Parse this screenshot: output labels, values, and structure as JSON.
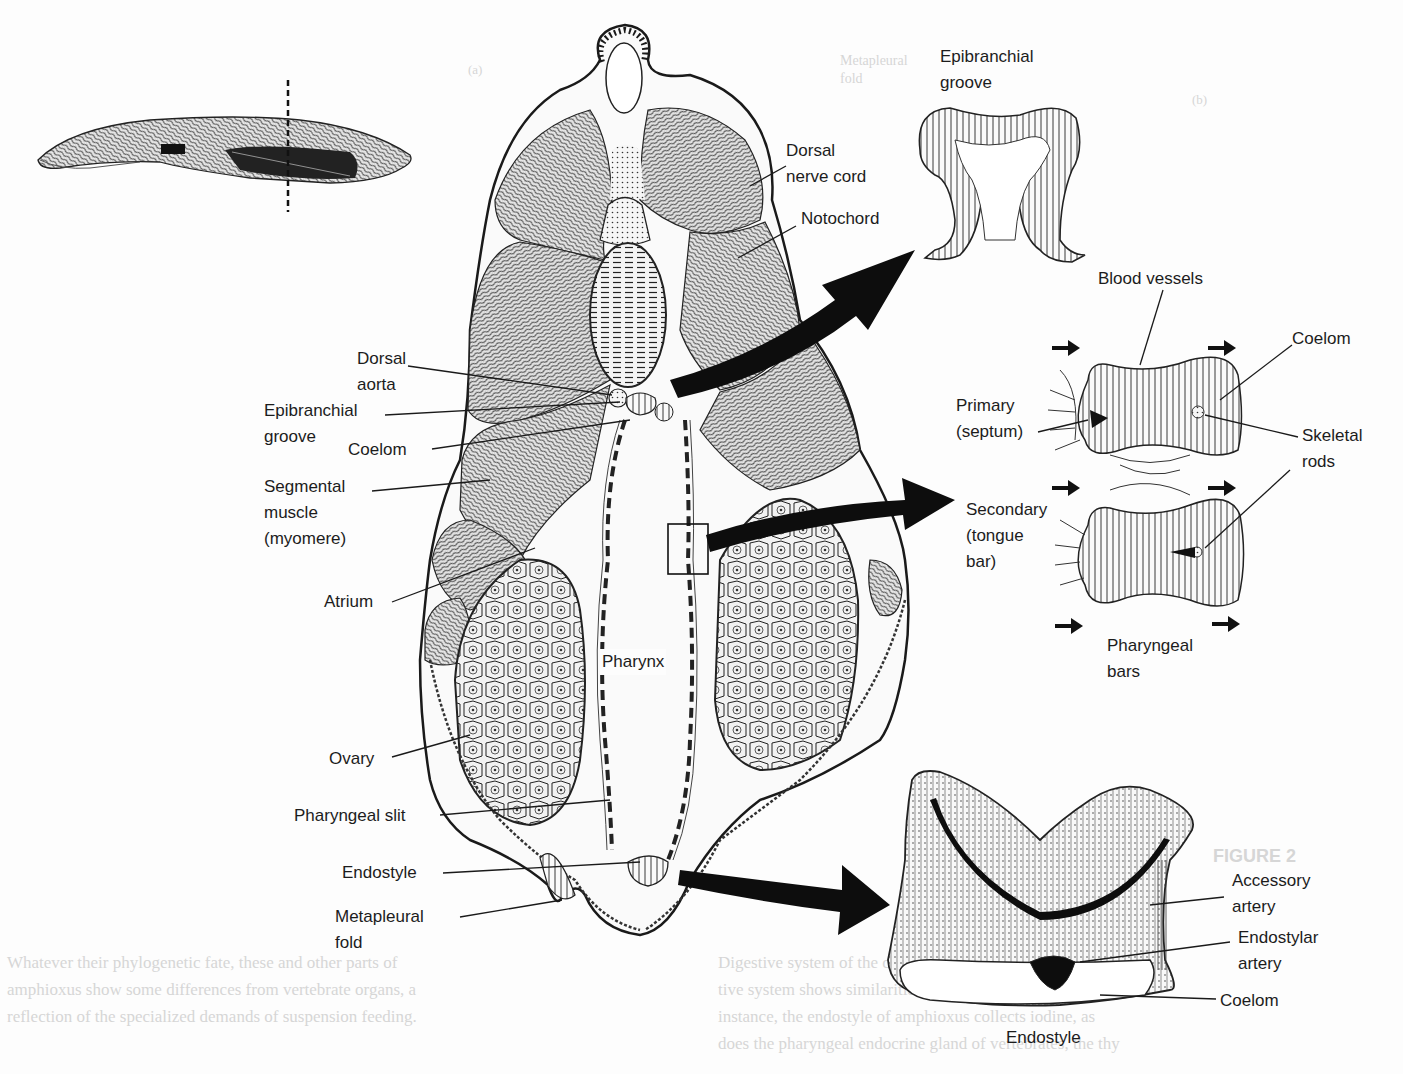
{
  "figure": {
    "orientation_inset": {
      "label": "whole-animal lateral view with section line"
    }
  },
  "labels": {
    "epibranchial_groove_inset": "Epibranchial\ngroove",
    "dorsal_nerve_cord": "Dorsal\nnerve cord",
    "notochord": "Notochord",
    "blood_vessels": "Blood vessels",
    "coelom_bars": "Coelom",
    "primary_septum": "Primary\n(septum)",
    "skeletal_rods": "Skeletal\nrods",
    "secondary_tongue_bar": "Secondary\n(tongue\nbar)",
    "pharyngeal_bars": "Pharyngeal\nbars",
    "dorsal_aorta": "Dorsal\naorta",
    "epibranchial_groove": "Epibranchial\ngroove",
    "coelom_main": "Coelom",
    "segmental_muscle": "Segmental\nmuscle\n(myomere)",
    "atrium": "Atrium",
    "pharynx": "Pharynx",
    "ovary": "Ovary",
    "pharyngeal_slit": "Pharyngeal slit",
    "endostyle_main": "Endostyle",
    "metapleural_fold": "Metapleural\nfold",
    "accessory_artery": "Accessory\nartery",
    "endostylar_artery": "Endostylar\nartery",
    "coelom_endostyle": "Coelom",
    "endostyle_inset": "Endostyle"
  },
  "bleed_through": {
    "top_a": "(a)",
    "top_b": "(b)",
    "metapleural_ghost": "Metapleural\nfold",
    "figure_ghost": "FIGURE 2",
    "col_left_1": "Whatever their phylogenetic fate, these and other parts of",
    "col_left_2": "amphioxus show some differences from vertebrate organs, a",
    "col_left_3": "reflection of the specialized demands of suspension feeding.",
    "col_right_1": "Digestive system of the cephalochordate dis-",
    "col_right_2": "tive system shows similarities to vertebrate organs. For",
    "col_right_3": "instance, the endostyle of amphioxus collects iodine, as",
    "col_right_4": "does the pharyngeal endocrine gland of vertebrates, the thy"
  },
  "colors": {
    "ink": "#1a1a1a",
    "paper": "#fdfdfd",
    "ghost": "#d6d6d6"
  }
}
